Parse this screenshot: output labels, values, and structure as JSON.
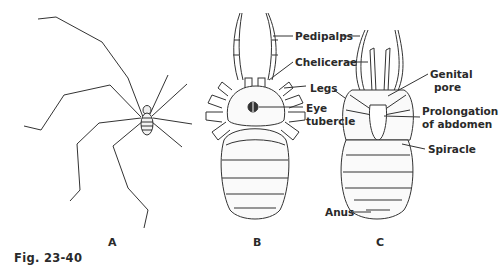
{
  "figure": {
    "caption": "Fig. 23-40",
    "panels": [
      {
        "id": "A",
        "label": "A"
      },
      {
        "id": "B",
        "label": "B"
      },
      {
        "id": "C",
        "label": "C"
      }
    ],
    "labels": {
      "pedipalps": "Pedipalps",
      "chelicerae": "Chelicerae",
      "legs": "Legs",
      "eye_line1": "Eye",
      "eye_line2": "tubercle",
      "genital_line1": "Genital",
      "genital_line2": "pore",
      "prolong_line1": "Prolongation",
      "prolong_line2": "of abdomen",
      "spiracle": "Spiracle",
      "anus": "Anus"
    },
    "colors": {
      "ink": "#2a2a2a",
      "background": "#ffffff"
    }
  }
}
